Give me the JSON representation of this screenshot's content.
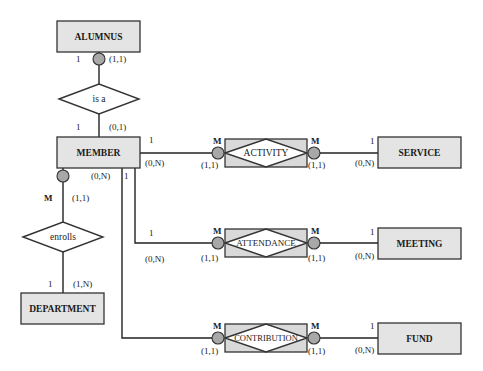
{
  "diagram": {
    "entities": {
      "alumnus": "ALUMNUS",
      "member": "MEMBER",
      "department": "DEPARTMENT",
      "service": "SERVICE",
      "meeting": "MEETING",
      "fund": "FUND"
    },
    "relationships": {
      "is_a": "is a",
      "enrolls": "enrolls",
      "activity": "ACTIVITY",
      "attendance": "ATTENDANCE",
      "contribution": "CONTRIBUTION"
    },
    "cardinalities": {
      "alumnus_isa": {
        "conn": "1",
        "card": "(1,1)"
      },
      "member_isa": {
        "conn": "1",
        "card": "(0,1)"
      },
      "member_enrolls": {
        "conn": "M",
        "card": "(1,1)"
      },
      "department_enrolls": {
        "conn": "1",
        "card": "(1,N)"
      },
      "member_activity": {
        "conn": "1",
        "card": "(0,N)"
      },
      "activity_member_side": {
        "conn": "M",
        "card": "(1,1)"
      },
      "activity_service_side": {
        "conn": "M",
        "card": "(1,1)"
      },
      "service_activity": {
        "conn": "1",
        "card": "(0,N)"
      },
      "member_attendance": {
        "conn": "1",
        "card": "(0,N)"
      },
      "attendance_member_side": {
        "conn": "M",
        "card": "(1,1)"
      },
      "attendance_meeting_side": {
        "conn": "M",
        "card": "(1,1)"
      },
      "meeting_attendance": {
        "conn": "1",
        "card": "(0,N)"
      },
      "member_contribution": {
        "conn": "1",
        "card": "(0,N)"
      },
      "contribution_member_side": {
        "conn": "M",
        "card": "(1,1)"
      },
      "contribution_fund_side": {
        "conn": "M",
        "card": "(1,1)"
      },
      "fund_contribution": {
        "conn": "1",
        "card": "(0,N)"
      }
    }
  }
}
